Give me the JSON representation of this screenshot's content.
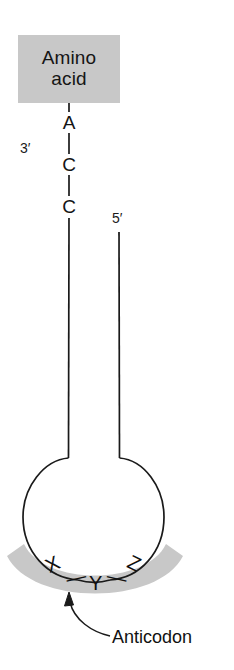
{
  "figure": {
    "type": "tRNA-structure-diagram",
    "background_color": "#ffffff",
    "line_color": "#1a1a1a",
    "highlight_color": "#c8c8c8"
  },
  "amino_acid_box": {
    "line1": "Amino",
    "line2": "acid",
    "fill": "#c8c8c8"
  },
  "acceptor_stem": {
    "nucleotides": [
      "A",
      "C",
      "C"
    ],
    "end_labels": {
      "three_prime": "3′",
      "five_prime": "5′"
    }
  },
  "anticodon_band": {
    "fill": "#c8c8c8",
    "letters": [
      "X",
      "Y",
      "Z"
    ],
    "separators": [
      "—",
      "—"
    ],
    "callout_label": "Anticodon"
  }
}
